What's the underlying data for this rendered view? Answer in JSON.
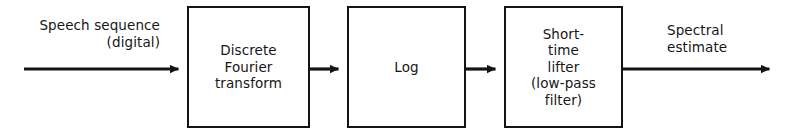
{
  "figure": {
    "kind": "signal-processing-block-diagram",
    "title_text": "",
    "background_color": "#ffffff",
    "ink_color": "#141414"
  },
  "blocks": [
    {
      "id": "dft",
      "label": "Discrete\nFourier\ntransform",
      "x": 187,
      "y": 6,
      "width": 123,
      "height": 122
    },
    {
      "id": "log",
      "label": "Log",
      "x": 347,
      "y": 6,
      "width": 119,
      "height": 122
    },
    {
      "id": "lifter",
      "label": "Short-\ntime\nlifter\n(low-pass\nfilter)",
      "x": 504,
      "y": 6,
      "width": 119,
      "height": 122
    }
  ],
  "arrows": [
    {
      "id": "input-arrow",
      "from": "source",
      "to": "dft",
      "x1": 24,
      "x2": 187,
      "y": 69
    },
    {
      "id": "dft-to-log-arrow",
      "from": "dft",
      "to": "log",
      "x1": 310,
      "x2": 347,
      "y": 69
    },
    {
      "id": "log-to-lifter-arrow",
      "from": "log",
      "to": "lifter",
      "x1": 466,
      "x2": 504,
      "y": 69
    },
    {
      "id": "output-arrow",
      "from": "lifter",
      "to": "sink",
      "x1": 623,
      "x2": 778,
      "y": 69
    }
  ],
  "edge_labels": {
    "input": "Speech sequence\n(digital)",
    "output": "Spectral\nestimate"
  }
}
